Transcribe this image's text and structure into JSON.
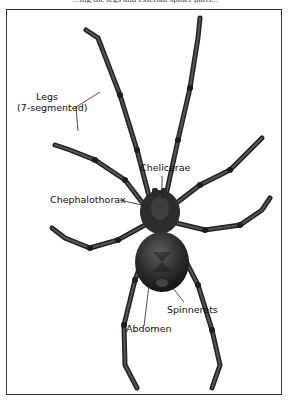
{
  "figure": {
    "top_caption_partial": "...ing the legs and external spider parts...",
    "labels": {
      "legs_line1": "Legs",
      "legs_line2": "(7-segmented)",
      "chelicerae": "Chelicerae",
      "cephalothorax": "Chephalothorax",
      "spinnerets": "Spinnerets",
      "abdomen": "Abdomen"
    },
    "colors": {
      "frame": "#333333",
      "body": "#2b2b2b",
      "highlight": "#5a5a5a",
      "leader_line": "#222222"
    }
  }
}
